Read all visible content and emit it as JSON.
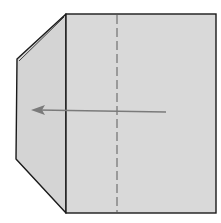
{
  "diagram": {
    "type": "origami-fold-step",
    "colors": {
      "background": "#ffffff",
      "paper": "#d9d9d9",
      "flap": "#d4d4d4",
      "outline": "#1a1a1a",
      "fold_line": "#8a8a8a",
      "arrow": "#7a7a7a"
    },
    "fold_line_style": "dashed",
    "arrow_direction": "left"
  }
}
